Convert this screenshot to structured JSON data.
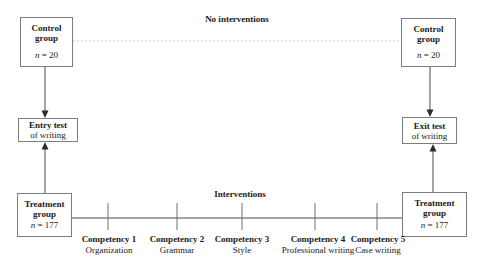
{
  "labels": {
    "no_interventions": "No interventions",
    "interventions": "Interventions"
  },
  "boxes": {
    "control_left": {
      "title": "Control group",
      "n_symbol": "n",
      "n_value": "= 20"
    },
    "control_right": {
      "title": "Control group",
      "n_symbol": "n",
      "n_value": "= 20"
    },
    "entry_test": {
      "title": "Entry test",
      "subtitle": "of writing"
    },
    "exit_test": {
      "title": "Exit test",
      "subtitle": "of writing"
    },
    "treatment_left": {
      "title": "Treatment group",
      "n_symbol": "n",
      "n_value": "= 177"
    },
    "treatment_right": {
      "title": "Treatment group",
      "n_symbol": "n",
      "n_value": "= 177"
    }
  },
  "competencies": [
    {
      "title": "Competency 1",
      "subtitle": "Organization"
    },
    {
      "title": "Competency 2",
      "subtitle": "Grammar"
    },
    {
      "title": "Competency 3",
      "subtitle": "Style"
    },
    {
      "title": "Competency 4",
      "subtitle": "Professional writing"
    },
    {
      "title": "Competency 5",
      "subtitle": "Case writing"
    }
  ],
  "colors": {
    "line": "#4a4a4a",
    "tick": "#6f6f6f",
    "faint_line": "#c9c9c9",
    "box_border": "#7d7d7d",
    "text": "#1a1a1a",
    "background": "#ffffff"
  }
}
